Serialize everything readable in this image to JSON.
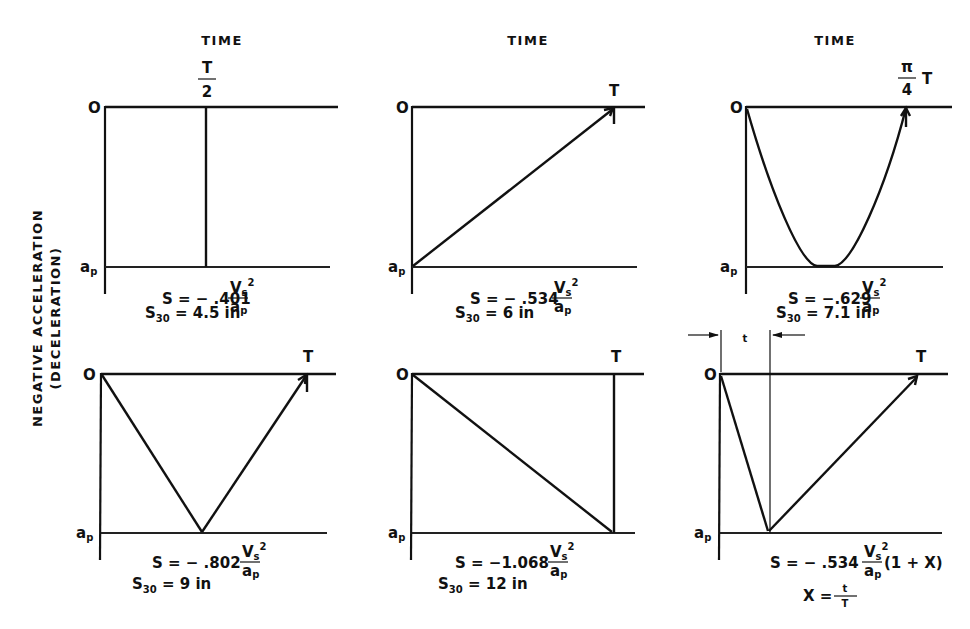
{
  "figure": {
    "y_axis_label": {
      "line1": "NEGATIVE   ACCELERATION",
      "line2": "(DECELERATION)"
    },
    "column_headers": [
      "TIME",
      "TIME",
      "TIME"
    ],
    "axis_ticks": {
      "zero": "O",
      "peak": "a",
      "peak_sub": "p"
    },
    "panels": [
      {
        "id": "square-pulse",
        "time_label_num": "T",
        "time_label_den": "2",
        "s_prefix": "S = − .401",
        "frac_num": "V",
        "frac_num_sub": "s",
        "frac_num_sup": "2",
        "frac_den": "a",
        "frac_den_sub": "p",
        "s30_prefix": "S",
        "s30_sub": "30",
        "s30_value": " = 4.5 in"
      },
      {
        "id": "ramp-up",
        "time_label": "T",
        "s_prefix": "S = − .534",
        "frac_num": "V",
        "frac_num_sub": "s",
        "frac_num_sup": "2",
        "frac_den": "a",
        "frac_den_sub": "p",
        "s30_prefix": "S",
        "s30_sub": "30",
        "s30_value": " = 6 in"
      },
      {
        "id": "half-sine",
        "time_label_num": "π",
        "time_label_den": "4",
        "time_label_suffix": "T",
        "s_prefix": "S = −.629",
        "frac_num": "V",
        "frac_num_sub": "s",
        "frac_num_sup": "2",
        "frac_den": "a",
        "frac_den_sub": "p",
        "s30_prefix": "S",
        "s30_sub": "30",
        "s30_value": " = 7.1 in"
      },
      {
        "id": "symmetric-triangle",
        "time_label": "T",
        "s_prefix": "S = − .802",
        "frac_num": "V",
        "frac_num_sub": "s",
        "frac_num_sup": "2",
        "frac_den": "a",
        "frac_den_sub": "p",
        "s30_prefix": "S",
        "s30_sub": "30",
        "s30_value": " = 9 in"
      },
      {
        "id": "ramp-down",
        "time_label": "T",
        "s_prefix": "S = −1.068",
        "frac_num": "V",
        "frac_num_sub": "s",
        "frac_num_sup": "2",
        "frac_den": "a",
        "frac_den_sub": "p",
        "s30_prefix": "S",
        "s30_sub": "30",
        "s30_value": " = 12 in"
      },
      {
        "id": "skewed-triangle",
        "time_label": "T",
        "rise_time_label": "t",
        "s_prefix": "S = − .534",
        "frac_num": "V",
        "frac_num_sub": "s",
        "frac_num_sup": "2",
        "frac_den": "a",
        "frac_den_sub": "p",
        "s_suffix": "(1 + X)",
        "x_def_prefix": "X = ",
        "x_def_num": "t",
        "x_def_den": "T"
      }
    ]
  }
}
